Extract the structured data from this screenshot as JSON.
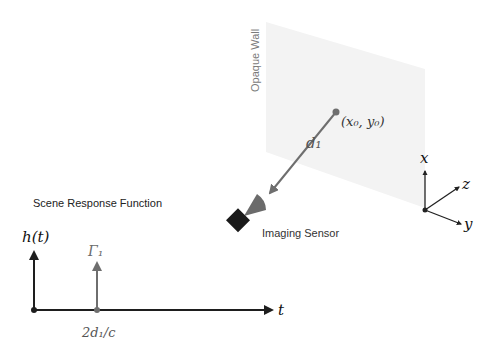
{
  "scene": {
    "wall_label": "Opaque Wall",
    "point_label": "(x₀, y₀)",
    "distance_label": "d₁",
    "sensor_label": "Imaging Sensor",
    "axes": {
      "x": "x",
      "y": "y",
      "z": "z"
    }
  },
  "response": {
    "title": "Scene Response Function",
    "y_axis_label": "h(t)",
    "x_axis_label": "t",
    "spike_label": "Γ₁",
    "spike_position_label": "2d₁/c"
  },
  "colors": {
    "wall_fill": "#f3f3f3",
    "ray_gray": "#6e6e6e",
    "sensor_body": "#1a1a1a",
    "cone_gray": "#6b6b6b",
    "axis_dark": "#1e1e1e",
    "text_gray": "#6a6a6a"
  }
}
